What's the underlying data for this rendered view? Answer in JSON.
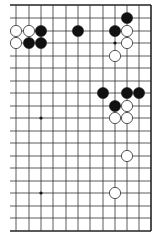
{
  "board": {
    "title": "Go problem diagram",
    "colors": {
      "background": "#ffffff",
      "line": "#333333",
      "edge": "#222222",
      "black_stone": "#111111",
      "white_stone": "#ffffff",
      "white_stone_stroke": "#444444"
    },
    "columns_x": [
      16,
      29,
      41,
      53,
      66,
      78,
      90,
      103,
      115,
      127,
      139,
      151
    ],
    "rows_y": [
      5,
      18,
      31,
      43,
      56,
      68,
      81,
      93,
      106,
      118,
      131,
      143,
      156,
      168,
      181,
      193,
      206,
      218,
      231
    ],
    "left_open_extent_x": 10,
    "edges": {
      "top": true,
      "right": true,
      "bottom": true,
      "left": false
    },
    "stone_radius": 5.6,
    "star_points": [
      {
        "c": 2,
        "r": 9
      },
      {
        "c": 2,
        "r": 15
      },
      {
        "c": 8,
        "r": 3
      },
      {
        "c": 8,
        "r": 9
      }
    ],
    "stones": [
      {
        "c": 9,
        "r": 1,
        "color": "black"
      },
      {
        "c": 0,
        "r": 2,
        "color": "white"
      },
      {
        "c": 1,
        "r": 2,
        "color": "white"
      },
      {
        "c": 2,
        "r": 2,
        "color": "black"
      },
      {
        "c": 5,
        "r": 2,
        "color": "black"
      },
      {
        "c": 8,
        "r": 2,
        "color": "black"
      },
      {
        "c": 9,
        "r": 2,
        "color": "white"
      },
      {
        "c": 0,
        "r": 3,
        "color": "white"
      },
      {
        "c": 1,
        "r": 3,
        "color": "black"
      },
      {
        "c": 2,
        "r": 3,
        "color": "black"
      },
      {
        "c": 9,
        "r": 3,
        "color": "white"
      },
      {
        "c": 8,
        "r": 4,
        "color": "white"
      },
      {
        "c": 7,
        "r": 7,
        "color": "black"
      },
      {
        "c": 9,
        "r": 7,
        "color": "black"
      },
      {
        "c": 10,
        "r": 7,
        "color": "black"
      },
      {
        "c": 8,
        "r": 8,
        "color": "black"
      },
      {
        "c": 9,
        "r": 8,
        "color": "white"
      },
      {
        "c": 8,
        "r": 9,
        "color": "white"
      },
      {
        "c": 9,
        "r": 9,
        "color": "white"
      },
      {
        "c": 9,
        "r": 12,
        "color": "white"
      },
      {
        "c": 8,
        "r": 15,
        "color": "white"
      }
    ]
  }
}
